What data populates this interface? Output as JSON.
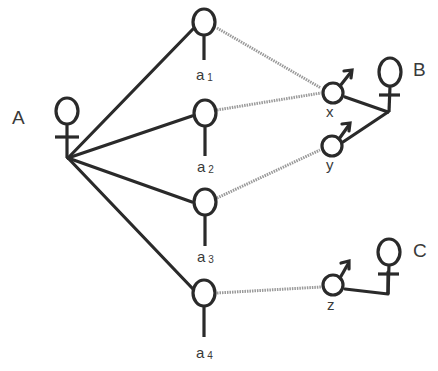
{
  "diagram": {
    "type": "kinship-network",
    "colors": {
      "solid_line": "#2a2a2a",
      "dotted_line": "#9a9a9a",
      "label": "#3a3a3a"
    },
    "nodes": {
      "A": {
        "label": "A",
        "sex": "female"
      },
      "a1": {
        "label": "a",
        "sub": "1",
        "sex": "unspecified"
      },
      "a2": {
        "label": "a",
        "sub": "2",
        "sex": "unspecified"
      },
      "a3": {
        "label": "a",
        "sub": "3",
        "sex": "unspecified"
      },
      "a4": {
        "label": "a",
        "sub": "4",
        "sex": "unspecified"
      },
      "x": {
        "label": "x",
        "sex": "male"
      },
      "y": {
        "label": "y",
        "sex": "male"
      },
      "z": {
        "label": "z",
        "sex": "male"
      },
      "B": {
        "label": "B",
        "sex": "female"
      },
      "C": {
        "label": "C",
        "sex": "female"
      }
    },
    "edges": [
      {
        "from": "A",
        "to": "a1",
        "style": "solid"
      },
      {
        "from": "A",
        "to": "a2",
        "style": "solid"
      },
      {
        "from": "A",
        "to": "a3",
        "style": "solid"
      },
      {
        "from": "A",
        "to": "a4",
        "style": "solid"
      },
      {
        "from": "a1",
        "to": "x",
        "style": "dotted"
      },
      {
        "from": "a2",
        "to": "x",
        "style": "dotted"
      },
      {
        "from": "a3",
        "to": "y",
        "style": "dotted"
      },
      {
        "from": "a4",
        "to": "z",
        "style": "dotted"
      },
      {
        "from": "x",
        "to": "B",
        "style": "solid"
      },
      {
        "from": "y",
        "to": "B",
        "style": "solid"
      },
      {
        "from": "z",
        "to": "C",
        "style": "solid"
      }
    ]
  }
}
